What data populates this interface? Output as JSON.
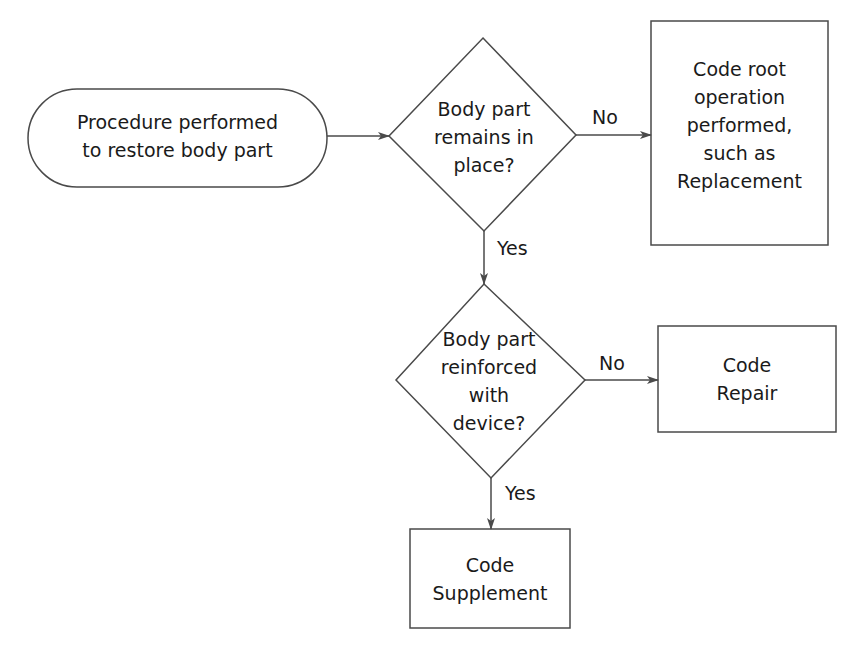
{
  "diagram": {
    "type": "flowchart",
    "nodes": {
      "start": {
        "shape": "terminal",
        "line1": "Procedure performed",
        "line2": "to restore body part"
      },
      "decision1": {
        "shape": "diamond",
        "line1": "Body part",
        "line2": "remains in",
        "line3": "place?"
      },
      "root_op": {
        "shape": "rectangle",
        "line1": "Code root",
        "line2": "operation",
        "line3": "performed,",
        "line4": "such as",
        "line5": "Replacement"
      },
      "decision2": {
        "shape": "diamond",
        "line1": "Body part",
        "line2": "reinforced",
        "line3": "with",
        "line4": "device?"
      },
      "repair": {
        "shape": "rectangle",
        "line1": "Code",
        "line2": "Repair"
      },
      "supplement": {
        "shape": "rectangle",
        "line1": "Code",
        "line2": "Supplement"
      }
    },
    "edges": {
      "start_to_d1": {
        "label": ""
      },
      "d1_no": {
        "label": "No"
      },
      "d1_yes": {
        "label": "Yes"
      },
      "d2_no": {
        "label": "No"
      },
      "d2_yes": {
        "label": "Yes"
      }
    },
    "colors": {
      "stroke": "#4a4a4a",
      "text": "#1a1a1a",
      "background": "#ffffff"
    }
  }
}
